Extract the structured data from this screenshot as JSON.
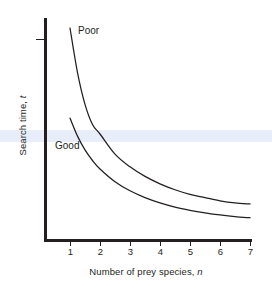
{
  "figure": {
    "background_color": "#ffffff",
    "ink_color": "#231f20",
    "highlight_band_color": "#e7edf9"
  },
  "chart_data": {
    "type": "line",
    "title": "",
    "xlabel_prefix": "Number of prey species, ",
    "xlabel_variable": "n",
    "ylabel_prefix": "Search time, ",
    "ylabel_variable": "t",
    "xlabel": "Number of prey species, n",
    "ylabel": "Search time, t",
    "xticks": [
      1,
      2,
      3,
      4,
      5,
      6,
      7
    ],
    "xtick_labels": [
      "1",
      "2",
      "3",
      "4",
      "5",
      "6",
      "7"
    ],
    "yticks": [
      1
    ],
    "ytick_labels": [
      ""
    ],
    "xlim": [
      0.55,
      7.45
    ],
    "ylim": [
      0,
      1
    ],
    "grid": false,
    "legend_position": "inline-annotation",
    "series": [
      {
        "name": "Poor",
        "label": "Poor",
        "annotation": "Poor",
        "x": [
          1,
          1.25,
          1.5,
          1.75,
          2,
          2.5,
          3,
          3.5,
          4,
          4.5,
          5,
          5.5,
          6,
          6.5,
          7
        ],
        "values": [
          1.0,
          0.79,
          0.64,
          0.545,
          0.5,
          0.405,
          0.345,
          0.3,
          0.265,
          0.237,
          0.215,
          0.2,
          0.185,
          0.175,
          0.17
        ]
      },
      {
        "name": "Good",
        "label": "Good",
        "annotation": "Good",
        "x": [
          1,
          1.25,
          1.5,
          1.75,
          2,
          2.5,
          3,
          3.5,
          4,
          4.5,
          5,
          5.5,
          6,
          6.5,
          7
        ],
        "values": [
          0.575,
          0.49,
          0.425,
          0.375,
          0.335,
          0.275,
          0.232,
          0.2,
          0.175,
          0.155,
          0.14,
          0.128,
          0.118,
          0.11,
          0.105
        ]
      }
    ]
  },
  "annotations": {
    "poor_label": "Poor",
    "good_label": "Good"
  }
}
